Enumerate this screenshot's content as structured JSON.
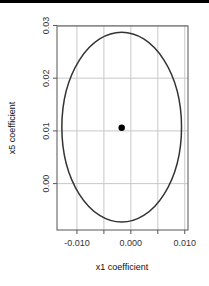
{
  "chart_data": {
    "type": "scatter",
    "title": "",
    "xlabel": "x1 coefficient",
    "ylabel": "x5 coefficient",
    "xlim": [
      -0.0137,
      0.0106
    ],
    "ylim": [
      -0.0088,
      0.0299
    ],
    "x_ticks": [
      -0.01,
      -0.005,
      0.0,
      0.005,
      0.01
    ],
    "x_tick_labels": [
      "-0.010",
      "",
      "0.000",
      "",
      "0.010"
    ],
    "y_ticks": [
      0.0,
      0.01,
      0.02,
      0.03
    ],
    "y_tick_labels": [
      "0.00",
      "0.01",
      "0.02",
      "0.03"
    ],
    "grid": true,
    "legend": "none",
    "series": [
      {
        "name": "point estimate",
        "type": "scatter",
        "x": [
          -0.0017
        ],
        "y": [
          0.0106
        ]
      },
      {
        "name": "confidence ellipse",
        "type": "ellipse",
        "center": [
          -0.0017,
          0.0107
        ],
        "half_width": 0.0111,
        "half_height": 0.018,
        "x_range": [
          -0.0128,
          0.0094
        ],
        "y_range": [
          -0.0073,
          0.0286
        ]
      }
    ]
  },
  "colors": {
    "frame": "#555555",
    "grid": "#c8c8c8",
    "ellipse": "#333333",
    "point": "#000000",
    "topbar": "#000000"
  }
}
